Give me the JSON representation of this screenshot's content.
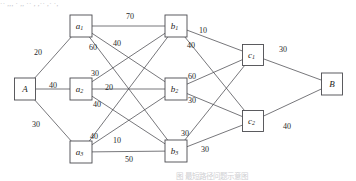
{
  "figure": {
    "top_clipped_text": "·· ,,, · ,, ·· , ,·· ,· ·,",
    "caption_clipped": "图            最短路径问题示意图",
    "line_color": "#4a4a4f",
    "node_fill": "#ffffff",
    "text_color": "#1d1d20",
    "background": "#ffffff"
  },
  "nodes": [
    {
      "id": "A",
      "label": "A",
      "sub": "",
      "x": 25,
      "y": 89,
      "w": 21,
      "h": 22
    },
    {
      "id": "a1",
      "label": "a",
      "sub": "1",
      "x": 81,
      "y": 26,
      "w": 22,
      "h": 22
    },
    {
      "id": "a2",
      "label": "a",
      "sub": "2",
      "x": 81,
      "y": 89,
      "w": 22,
      "h": 22
    },
    {
      "id": "a3",
      "label": "a",
      "sub": "3",
      "x": 81,
      "y": 152,
      "w": 22,
      "h": 22
    },
    {
      "id": "b1",
      "label": "b",
      "sub": "1",
      "x": 176,
      "y": 26,
      "w": 22,
      "h": 22
    },
    {
      "id": "b2",
      "label": "b",
      "sub": "2",
      "x": 176,
      "y": 89,
      "w": 22,
      "h": 22
    },
    {
      "id": "b3",
      "label": "b",
      "sub": "3",
      "x": 176,
      "y": 151,
      "w": 22,
      "h": 22
    },
    {
      "id": "c1",
      "label": "c",
      "sub": "1",
      "x": 253,
      "y": 55,
      "w": 21,
      "h": 21
    },
    {
      "id": "c2",
      "label": "c",
      "sub": "2",
      "x": 253,
      "y": 121,
      "w": 21,
      "h": 21
    },
    {
      "id": "B",
      "label": "B",
      "sub": "",
      "x": 332,
      "y": 84,
      "w": 21,
      "h": 22
    }
  ],
  "edges": [
    {
      "from": "A",
      "to": "a1",
      "weight": "20",
      "lx": 38,
      "ly": 53
    },
    {
      "from": "A",
      "to": "a2",
      "weight": "40",
      "lx": 53,
      "ly": 86
    },
    {
      "from": "A",
      "to": "a3",
      "weight": "30",
      "lx": 36,
      "ly": 125
    },
    {
      "from": "a1",
      "to": "b1",
      "weight": "70",
      "lx": 130,
      "ly": 17
    },
    {
      "from": "a1",
      "to": "b2",
      "weight": "60",
      "lx": 93,
      "ly": 48
    },
    {
      "from": "a1",
      "to": "b3",
      "weight": "40",
      "lx": 117,
      "ly": 44
    },
    {
      "from": "a2",
      "to": "b1",
      "weight": "30",
      "lx": 95,
      "ly": 74
    },
    {
      "from": "a2",
      "to": "b2",
      "weight": "20",
      "lx": 109,
      "ly": 88
    },
    {
      "from": "a2",
      "to": "b3",
      "weight": "40",
      "lx": 97,
      "ly": 105
    },
    {
      "from": "a3",
      "to": "b1",
      "weight": "40",
      "lx": 94,
      "ly": 137
    },
    {
      "from": "a3",
      "to": "b2",
      "weight": "10",
      "lx": 117,
      "ly": 141
    },
    {
      "from": "a3",
      "to": "b3",
      "weight": "50",
      "lx": 129,
      "ly": 160
    },
    {
      "from": "b1",
      "to": "c1",
      "weight": "10",
      "lx": 203,
      "ly": 31
    },
    {
      "from": "b1",
      "to": "c2",
      "weight": "40",
      "lx": 191,
      "ly": 46
    },
    {
      "from": "b2",
      "to": "c1",
      "weight": "60",
      "lx": 192,
      "ly": 77
    },
    {
      "from": "b2",
      "to": "c2",
      "weight": "30",
      "lx": 192,
      "ly": 101
    },
    {
      "from": "b3",
      "to": "c1",
      "weight": "30",
      "lx": 185,
      "ly": 134
    },
    {
      "from": "b3",
      "to": "c2",
      "weight": "30",
      "lx": 205,
      "ly": 150
    },
    {
      "from": "c1",
      "to": "B",
      "weight": "30",
      "lx": 283,
      "ly": 50
    },
    {
      "from": "c2",
      "to": "B",
      "weight": "40",
      "lx": 287,
      "ly": 127
    }
  ]
}
